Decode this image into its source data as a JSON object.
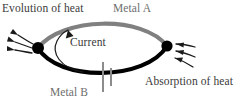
{
  "figure": {
    "width": 237,
    "height": 110,
    "background": "#ffffff",
    "labels": {
      "evolution_of_heat": "Evolution of heat",
      "metal_a": "Metal A",
      "current": "Current",
      "metal_b": "Metal B",
      "absorption_of_heat": "Absorption of heat"
    },
    "colors": {
      "metal_a_arc": "#808080",
      "metal_b_arc": "#000000",
      "junction_node": "#000000",
      "heat_arrow": "#1a1a1a",
      "current_arrow": "#1a1a1a",
      "cell_symbol": "#8c8c8c",
      "label_dark": "#3a3a3a",
      "label_gray": "#6e6e6e"
    },
    "elements": {
      "left_junction": "hot-junction-node",
      "right_junction": "cold-junction-node",
      "heat_out_arrows": 3,
      "heat_in_arrows": 3,
      "cell_symbol": "battery-cell-symbol",
      "current_direction": "counterclockwise"
    }
  }
}
